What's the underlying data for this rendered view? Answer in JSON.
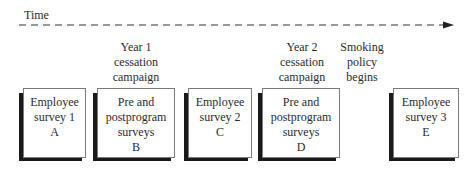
{
  "timeline": {
    "label": "Time",
    "style": "dashed",
    "direction": "right",
    "color": "#333333"
  },
  "events": [
    {
      "id": "year1",
      "lines": [
        "Year 1",
        "cessation",
        "campaign"
      ],
      "center_x": 136
    },
    {
      "id": "year2",
      "lines": [
        "Year 2",
        "cessation",
        "campaign"
      ],
      "center_x": 302
    },
    {
      "id": "policy",
      "lines": [
        "Smoking",
        "policy",
        "begins"
      ],
      "center_x": 361
    }
  ],
  "boxes": [
    {
      "id": "A",
      "lines": [
        "Employee",
        "survey 1",
        "A"
      ],
      "x": 23,
      "w": 63
    },
    {
      "id": "B",
      "lines": [
        "Pre and",
        "postprogram",
        "surveys",
        "B"
      ],
      "x": 97,
      "w": 78
    },
    {
      "id": "C",
      "lines": [
        "Employee",
        "survey 2",
        "C"
      ],
      "x": 188,
      "w": 64
    },
    {
      "id": "D",
      "lines": [
        "Pre and",
        "postprogram",
        "surveys",
        "D"
      ],
      "x": 262,
      "w": 78
    },
    {
      "id": "E",
      "lines": [
        "Employee",
        "survey 3",
        "E"
      ],
      "x": 393,
      "w": 66
    }
  ],
  "colors": {
    "text": "#2a2a2a",
    "box_border": "#7a7a7a",
    "box_shadow": "#1a1a1a",
    "background": "#ffffff"
  }
}
